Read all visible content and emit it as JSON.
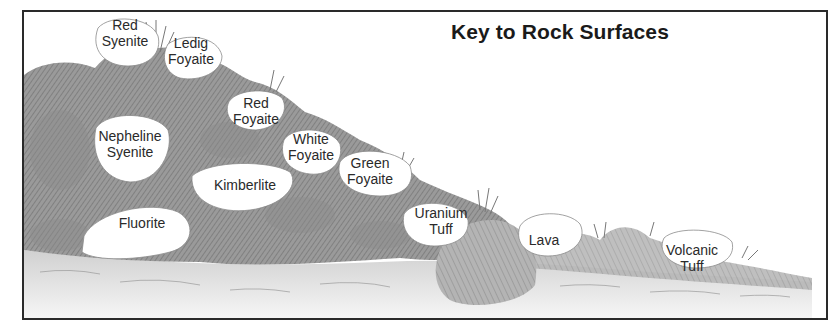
{
  "title": "Key to Rock Surfaces",
  "colors": {
    "frame": "#2a2a2a",
    "rock_dark": "#7a7a7a",
    "rock_mid": "#a8a8a8",
    "rock_light": "#cfcfcf",
    "ground": "#e6e6e6",
    "label_text": "#2a2a2a"
  },
  "labels": [
    {
      "id": "red-syenite",
      "line1": "Red",
      "line2": "Syenite",
      "x": 125,
      "y": 17
    },
    {
      "id": "ledig-foyaite",
      "line1": "Ledig",
      "line2": "Foyaite",
      "x": 191,
      "y": 35
    },
    {
      "id": "red-foyaite",
      "line1": "Red",
      "line2": "Foyaite",
      "x": 256,
      "y": 95
    },
    {
      "id": "nepheline-syenite",
      "line1": "Nepheline",
      "line2": "Syenite",
      "x": 130,
      "y": 128
    },
    {
      "id": "white-foyaite",
      "line1": "White",
      "line2": "Foyaite",
      "x": 311,
      "y": 131
    },
    {
      "id": "green-foyaite",
      "line1": "Green",
      "line2": "Foyaite",
      "x": 370,
      "y": 155
    },
    {
      "id": "kimberlite",
      "line1": "Kimberlite",
      "line2": "",
      "x": 245,
      "y": 177
    },
    {
      "id": "fluorite",
      "line1": "Fluorite",
      "line2": "",
      "x": 142,
      "y": 215
    },
    {
      "id": "uranium-tuff",
      "line1": "Uranium",
      "line2": "Tuff",
      "x": 441,
      "y": 205
    },
    {
      "id": "lava",
      "line1": "Lava",
      "line2": "",
      "x": 544,
      "y": 232
    },
    {
      "id": "volcanic-tuff",
      "line1": "Volcanic",
      "line2": "Tuff",
      "x": 692,
      "y": 242
    }
  ]
}
